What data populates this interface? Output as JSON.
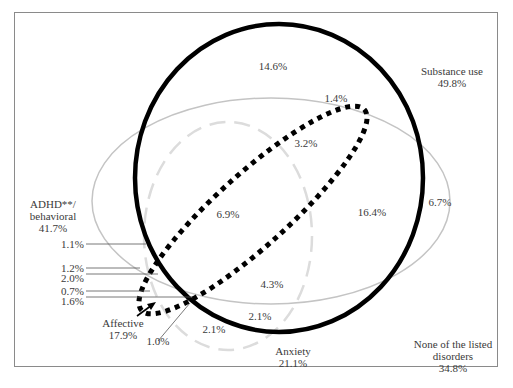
{
  "diagram": {
    "type": "euler-venn",
    "sets": [
      {
        "name": "Substance use",
        "value": "49.8%",
        "style": "solid-black-thick"
      },
      {
        "name": "ADHD**/ behavioral",
        "value": "41.7%",
        "style": "solid-gray-thin"
      },
      {
        "name": "Anxiety",
        "value": "21.1%",
        "style": "dashed-light-gray"
      },
      {
        "name": "Affective",
        "value": "17.9%",
        "style": "dotted-black"
      }
    ],
    "outside": {
      "name": "None of the listed disorders",
      "value": "34.8%"
    }
  },
  "labels": {
    "substance": {
      "line1": "Substance use",
      "line2": "49.8%"
    },
    "adhd": {
      "line1": "ADHD**/",
      "line2": "behavioral",
      "line3": "41.7%"
    },
    "affective": {
      "line1": "Affective",
      "line2": "17.9%"
    },
    "anxiety": {
      "line1": "Anxiety",
      "line2": "21.1%"
    },
    "none": {
      "line1": "None of the listed",
      "line2": "disorders",
      "line3": "34.8%"
    }
  },
  "regions": {
    "substance_only": "14.6%",
    "substance_affective_top": "1.4%",
    "substance_adhd_affective": "3.2%",
    "adhd_affective_anxiety": "6.9%",
    "substance_adhd": "16.4%",
    "adhd_only": "6.7%",
    "substance_adhd_affective_anxiety": "4.3%",
    "substance_anxiety": "2.1%",
    "anxiety_only": "2.1%",
    "callout_1_0": "1.0%",
    "left_1_1": "1.1%",
    "left_1_2": "1.2%",
    "left_2_0": "2.0%",
    "left_0_7": "0.7%",
    "left_1_6": "1.6%"
  },
  "colors": {
    "substance": "#000000",
    "adhd": "#c4c4c4",
    "anxiety": "#dcdcdc",
    "affective": "#000000",
    "frame": "#8a8a8a",
    "text": "#3a3a3a"
  }
}
